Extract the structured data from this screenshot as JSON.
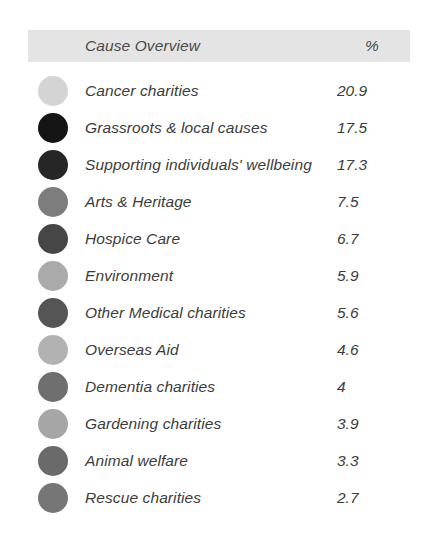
{
  "header": {
    "title": "Cause Overview",
    "percent_label": "%",
    "background_color": "#e4e4e4"
  },
  "chart_data": {
    "type": "table",
    "title": "Cause Overview",
    "columns": [
      "Cause Overview",
      "%"
    ],
    "xlabel": "",
    "ylabel": "%",
    "legend": "left-swatches",
    "categories": [
      "Cancer charities",
      "Grassroots & local causes",
      "Supporting individuals' wellbeing",
      "Arts & Heritage",
      "Hospice Care",
      "Environment",
      "Other Medical charities",
      "Overseas Aid",
      "Dementia charities",
      "Gardening charities",
      "Animal welfare",
      "Rescue charities"
    ],
    "values": [
      20.9,
      17.5,
      17.3,
      7.5,
      6.7,
      5.9,
      5.6,
      4.6,
      4,
      3.9,
      3.3,
      2.7
    ],
    "rows": [
      {
        "label": "Cancer charities",
        "value": "20.9",
        "color": "#d4d4d4"
      },
      {
        "label": "Grassroots & local causes",
        "value": "17.5",
        "color": "#151515"
      },
      {
        "label": "Supporting individuals' wellbeing",
        "value": "17.3",
        "color": "#262626"
      },
      {
        "label": "Arts & Heritage",
        "value": "7.5",
        "color": "#7d7d7d"
      },
      {
        "label": "Hospice Care",
        "value": "6.7",
        "color": "#464646"
      },
      {
        "label": "Environment",
        "value": "5.9",
        "color": "#aaaaaa"
      },
      {
        "label": "Other Medical charities",
        "value": "5.6",
        "color": "#555555"
      },
      {
        "label": "Overseas Aid",
        "value": "4.6",
        "color": "#b2b2b2"
      },
      {
        "label": "Dementia charities",
        "value": "4",
        "color": "#6f6f6f"
      },
      {
        "label": "Gardening charities",
        "value": "3.9",
        "color": "#a6a6a6"
      },
      {
        "label": "Animal welfare",
        "value": "3.3",
        "color": "#6a6a6a"
      },
      {
        "label": "Rescue charities",
        "value": "2.7",
        "color": "#767676"
      }
    ]
  }
}
